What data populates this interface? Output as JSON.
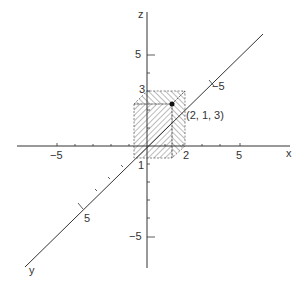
{
  "figure": {
    "axes": {
      "x": "x",
      "y": "y",
      "z": "z"
    },
    "tick_labels": {
      "x_neg5": "−5",
      "x_pos5": "5",
      "x_2": "2",
      "z_pos5": "5",
      "z_neg5": "−5",
      "z_3": "3",
      "y_pos5": "5",
      "y_neg5": "−5",
      "y_1": "1"
    },
    "point_label": "(2, 1, 3)",
    "colors": {
      "line": "#333333",
      "background": "#ffffff"
    }
  }
}
